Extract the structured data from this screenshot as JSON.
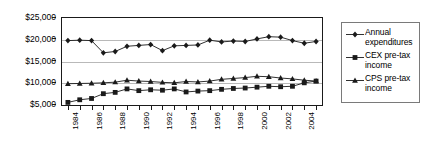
{
  "chart_data": {
    "type": "line",
    "title": "",
    "xlabel": "",
    "ylabel": "",
    "ylim": [
      5000,
      25000
    ],
    "ytick_values": [
      25000,
      20000,
      15000,
      10000,
      5000
    ],
    "ytick_labels": [
      "$25,000",
      "$20,000",
      "$15,000",
      "$10,000",
      "$5,000"
    ],
    "grid": true,
    "legend_position": "right",
    "x": [
      1984,
      1985,
      1986,
      1987,
      1988,
      1989,
      1990,
      1991,
      1992,
      1993,
      1994,
      1995,
      1996,
      1997,
      1998,
      1999,
      2000,
      2001,
      2002,
      2003,
      2004,
      2005
    ],
    "xtick_labels": [
      "1984",
      "",
      "1986",
      "",
      "1988",
      "",
      "1990",
      "",
      "1992",
      "",
      "1994",
      "",
      "1996",
      "",
      "1998",
      "",
      "2000",
      "",
      "2002",
      "",
      "2004",
      ""
    ],
    "series": [
      {
        "name": "Annual expenditures",
        "marker": "diamond",
        "values": [
          19800,
          19900,
          19800,
          17000,
          17300,
          18500,
          18700,
          18900,
          17500,
          18600,
          18700,
          18800,
          19900,
          19500,
          19700,
          19600,
          20200,
          20700,
          20600,
          19800,
          19200,
          19600
        ]
      },
      {
        "name": "CEX pre-tax income",
        "marker": "square",
        "values": [
          5600,
          6200,
          6500,
          7600,
          7900,
          8700,
          8300,
          8500,
          8400,
          8700,
          8000,
          8200,
          8300,
          8600,
          8800,
          8900,
          9100,
          9300,
          9200,
          9300,
          10100,
          10500
        ]
      },
      {
        "name": "CPS pre-tax income",
        "marker": "triangle",
        "values": [
          9900,
          9950,
          10000,
          10100,
          10250,
          10700,
          10500,
          10400,
          10200,
          10100,
          10400,
          10300,
          10500,
          10900,
          11100,
          11300,
          11600,
          11500,
          11200,
          11000,
          10700,
          10500
        ]
      }
    ]
  },
  "legend": {
    "items": [
      {
        "label_line1": "Annual",
        "label_line2": "expenditures",
        "marker": "diamond"
      },
      {
        "label_line1": "CEX pre-tax",
        "label_line2": "income",
        "marker": "square"
      },
      {
        "label_line1": "CPS pre-tax",
        "label_line2": "income",
        "marker": "triangle"
      }
    ]
  },
  "colors": {
    "series": "#1a1a1a",
    "grid": "#b9b9b9",
    "frame": "#1a1a1a",
    "legend_border": "#7a7a7a"
  }
}
